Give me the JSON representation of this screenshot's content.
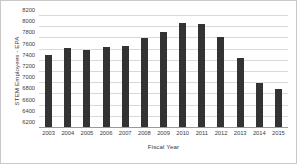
{
  "chart_data": {
    "type": "bar",
    "title": "",
    "xlabel": "Fiscal Year",
    "ylabel": "STEM Employees - EPA",
    "categories": [
      "2003",
      "2004",
      "2005",
      "2006",
      "2007",
      "2008",
      "2009",
      "2010",
      "2011",
      "2012",
      "2013",
      "2014",
      "2015"
    ],
    "values": [
      7510,
      7620,
      7600,
      7650,
      7670,
      7800,
      7910,
      8070,
      8060,
      7830,
      7450,
      7000,
      6890
    ],
    "ylim": [
      6200,
      8200
    ],
    "yticks": [
      6200,
      6400,
      6600,
      6800,
      7000,
      7200,
      7400,
      7600,
      7800,
      8000,
      8200
    ],
    "ytick_labels": [
      "6200",
      "6400",
      "6600",
      "6800",
      "7000",
      "7200",
      "7400",
      "7600",
      "7800",
      "8000",
      "8200"
    ],
    "grid": true,
    "legend": false,
    "bar_color": "#333333",
    "gridline_color": "#d9d9d9",
    "axis_color": "#9a9a9a",
    "border_color": "#c9c9c9"
  }
}
